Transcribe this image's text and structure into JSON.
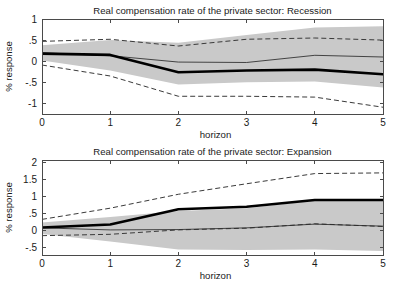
{
  "figure": {
    "background_color": "#ffffff",
    "band_color": "#c9c9c9",
    "line_color": "#000000"
  },
  "chart_data": [
    {
      "type": "line",
      "panel_id": "recession",
      "title": "Real compensation rate of the private sector: Recession",
      "xlabel": "horizon",
      "ylabel": "% response",
      "xlim": [
        0,
        5
      ],
      "ylim": [
        -1.25,
        1.0
      ],
      "xticks": [
        0,
        1,
        2,
        3,
        4,
        5
      ],
      "xticklabels": [
        "0",
        "1",
        "2",
        "3",
        "4",
        "5"
      ],
      "yticks": [
        -1,
        -0.5,
        0,
        0.5,
        1
      ],
      "yticklabels": [
        "-1",
        "-.5",
        "0",
        ".5",
        "1"
      ],
      "grid": false,
      "legend": "none",
      "x": [
        0,
        1,
        2,
        3,
        4,
        5
      ],
      "series": [
        {
          "name": "Median response (bold solid)",
          "style": "bold-solid",
          "values": [
            0.18,
            0.15,
            -0.26,
            -0.22,
            -0.2,
            -0.31
          ]
        },
        {
          "name": "Secondary response (thin solid)",
          "style": "thin-solid",
          "values": [
            0.2,
            0.13,
            -0.02,
            -0.03,
            0.14,
            0.1
          ]
        },
        {
          "name": "Upper confidence band (dashed)",
          "style": "dashed",
          "values": [
            0.47,
            0.52,
            0.36,
            0.52,
            0.55,
            0.5
          ]
        },
        {
          "name": "Lower confidence band (dashed)",
          "style": "dashed",
          "values": [
            -0.09,
            -0.35,
            -0.83,
            -0.83,
            -0.85,
            -1.09
          ]
        },
        {
          "name": "Shaded band upper",
          "style": "band-upper",
          "values": [
            0.38,
            0.5,
            0.44,
            0.62,
            0.8,
            0.83
          ]
        },
        {
          "name": "Shaded band lower",
          "style": "band-lower",
          "values": [
            0.02,
            -0.22,
            -0.55,
            -0.5,
            -0.48,
            -0.62
          ]
        }
      ]
    },
    {
      "type": "line",
      "panel_id": "expansion",
      "title": "Real compensation rate of the private sector: Expansion",
      "xlabel": "horizon",
      "ylabel": "% response",
      "xlim": [
        0,
        5
      ],
      "ylim": [
        -0.72,
        2.08
      ],
      "xticks": [
        0,
        1,
        2,
        3,
        4,
        5
      ],
      "xticklabels": [
        "0",
        "1",
        "2",
        "3",
        "4",
        "5"
      ],
      "yticks": [
        -0.5,
        0,
        0.5,
        1,
        1.5,
        2
      ],
      "yticklabels": [
        "-.5",
        "0",
        ".5",
        "1",
        "1.5",
        "2"
      ],
      "grid": false,
      "legend": "none",
      "x": [
        0,
        1,
        2,
        3,
        4,
        5
      ],
      "series": [
        {
          "name": "Median response (bold solid)",
          "style": "bold-solid",
          "values": [
            0.09,
            0.18,
            0.63,
            0.7,
            0.9,
            0.9
          ]
        },
        {
          "name": "Secondary response (thin solid)",
          "style": "thin-solid",
          "values": [
            0.08,
            0.02,
            0.03,
            0.08,
            0.19,
            0.13
          ]
        },
        {
          "name": "Upper confidence band (dashed)",
          "style": "dashed",
          "values": [
            0.33,
            0.66,
            1.07,
            1.38,
            1.68,
            1.7
          ]
        },
        {
          "name": "Lower confidence band (dashed)",
          "style": "dashed",
          "values": [
            -0.15,
            -0.11,
            0.02,
            0.07,
            0.2,
            0.12
          ]
        },
        {
          "name": "Shaded band upper",
          "style": "band-upper",
          "values": [
            0.24,
            0.4,
            0.58,
            0.66,
            0.89,
            0.89
          ]
        },
        {
          "name": "Shaded band lower",
          "style": "band-lower",
          "values": [
            -0.1,
            -0.32,
            -0.56,
            -0.57,
            -0.56,
            -0.6
          ]
        }
      ]
    }
  ]
}
